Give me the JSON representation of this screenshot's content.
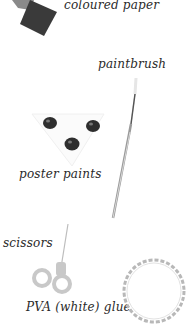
{
  "items": [
    {
      "id": "coloured-paper",
      "label": "coloured paper"
    },
    {
      "id": "paintbrush",
      "label": "paintbrush"
    },
    {
      "id": "poster-paints",
      "label": "poster paints"
    },
    {
      "id": "scissors",
      "label": "scissors"
    },
    {
      "id": "pva-glue",
      "label": "PVA (white) glue"
    }
  ],
  "colors": {
    "paper_light": "#8a8a8a",
    "paper_dark": "#3a3a3a",
    "paint_pots": "#2e2e2e",
    "scissors_handle": "#c8c8c8",
    "glue_ring": "#b8b8b8"
  }
}
